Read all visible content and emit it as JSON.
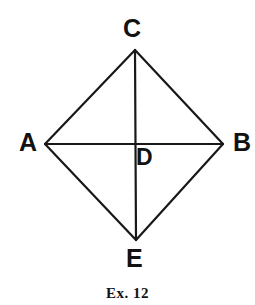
{
  "figure": {
    "caption": "Ex. 12",
    "stroke_color": "#181818",
    "background_color": "#ffffff",
    "label_color": "#121212",
    "stroke_width": 2.2,
    "vertices": [
      {
        "name": "A",
        "label": "A",
        "x": 45,
        "y": 144
      },
      {
        "name": "B",
        "label": "B",
        "x": 223,
        "y": 144
      },
      {
        "name": "C",
        "label": "C",
        "x": 135,
        "y": 50
      },
      {
        "name": "D",
        "label": "D",
        "x": 134,
        "y": 143
      },
      {
        "name": "E",
        "label": "E",
        "x": 136,
        "y": 240
      }
    ],
    "segments": [
      {
        "name": "side-AC",
        "from": "A",
        "to": "C"
      },
      {
        "name": "side-CB",
        "from": "C",
        "to": "B"
      },
      {
        "name": "side-BE",
        "from": "B",
        "to": "E"
      },
      {
        "name": "side-EA",
        "from": "E",
        "to": "A"
      },
      {
        "name": "diagonal-AB",
        "from": "A",
        "to": "B"
      },
      {
        "name": "diagonal-CE",
        "from": "C",
        "to": "E"
      }
    ],
    "labels": {
      "A": "A",
      "B": "B",
      "C": "C",
      "D": "D",
      "E": "E"
    }
  }
}
